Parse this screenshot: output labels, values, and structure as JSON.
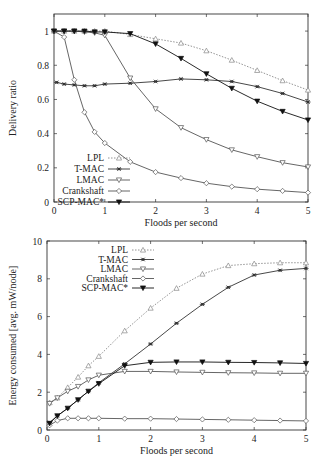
{
  "chart_data": [
    {
      "type": "line",
      "title": "",
      "xlabel": "Floods per second",
      "ylabel": "Delivery ratio",
      "xlim": [
        0,
        5
      ],
      "ylim": [
        0,
        1.1
      ],
      "xticks": [
        "0",
        "1",
        "2",
        "3",
        "4",
        "5"
      ],
      "yticks": [
        "0",
        "0.2",
        "0.4",
        "0.6",
        "0.8",
        "1"
      ],
      "grid": false,
      "legend_position": "lower left",
      "series": [
        {
          "name": "LPL",
          "style": "dotted",
          "marker": "triangle-up-open",
          "x": [
            0,
            0.2,
            0.4,
            0.6,
            0.8,
            1,
            1.5,
            2,
            2.5,
            3,
            3.5,
            4,
            4.5,
            5
          ],
          "values": [
            1,
            1,
            1,
            1,
            1,
            1,
            0.98,
            0.955,
            0.93,
            0.885,
            0.83,
            0.77,
            0.71,
            0.655
          ]
        },
        {
          "name": "T-MAC",
          "style": "solid",
          "marker": "star",
          "x": [
            0.05,
            0.2,
            0.4,
            0.6,
            0.8,
            1,
            1.5,
            2,
            2.5,
            3,
            3.5,
            4,
            4.5,
            5
          ],
          "values": [
            0.7,
            0.69,
            0.685,
            0.68,
            0.68,
            0.69,
            0.695,
            0.705,
            0.72,
            0.715,
            0.705,
            0.675,
            0.635,
            0.585
          ]
        },
        {
          "name": "LMAC",
          "style": "solid",
          "marker": "triangle-down-open",
          "x": [
            0,
            0.2,
            0.4,
            0.6,
            0.8,
            1,
            1.5,
            2,
            2.5,
            3,
            3.5,
            4,
            4.5,
            5
          ],
          "values": [
            1,
            1,
            1,
            0.995,
            0.99,
            0.975,
            0.725,
            0.545,
            0.435,
            0.365,
            0.305,
            0.265,
            0.23,
            0.205
          ]
        },
        {
          "name": "Crankshaft",
          "style": "solid",
          "marker": "diamond-open",
          "x": [
            0,
            0.2,
            0.4,
            0.6,
            0.8,
            1,
            1.5,
            2,
            2.5,
            3,
            3.5,
            4,
            4.5,
            5
          ],
          "values": [
            1,
            0.965,
            0.715,
            0.525,
            0.41,
            0.345,
            0.235,
            0.175,
            0.14,
            0.11,
            0.09,
            0.075,
            0.065,
            0.055
          ]
        },
        {
          "name": "SCP-MAC*",
          "style": "solid",
          "marker": "triangle-down-filled",
          "x": [
            0,
            0.2,
            0.4,
            0.6,
            0.8,
            1,
            1.5,
            2,
            2.5,
            3,
            3.5,
            4,
            4.5,
            5
          ],
          "values": [
            1,
            1,
            1,
            1,
            0.995,
            0.995,
            0.985,
            0.925,
            0.84,
            0.75,
            0.665,
            0.59,
            0.53,
            0.48
          ]
        }
      ]
    },
    {
      "type": "line",
      "title": "",
      "xlabel": "Floods per second",
      "ylabel": "Energy consumed [avg. mW/node]",
      "xlim": [
        0,
        5
      ],
      "ylim": [
        0,
        10
      ],
      "xticks": [
        "0",
        "1",
        "2",
        "3",
        "4",
        "5"
      ],
      "yticks": [
        "0",
        "2",
        "4",
        "6",
        "8",
        "10"
      ],
      "grid": false,
      "legend_position": "upper left",
      "series": [
        {
          "name": "LPL",
          "style": "dotted",
          "marker": "triangle-up-open",
          "x": [
            0.05,
            0.2,
            0.4,
            0.6,
            0.8,
            1,
            1.5,
            2,
            2.5,
            3,
            3.5,
            4,
            4.5,
            5
          ],
          "values": [
            1.45,
            1.7,
            2.25,
            2.8,
            3.4,
            3.9,
            5.25,
            6.45,
            7.5,
            8.25,
            8.7,
            8.8,
            8.85,
            8.85
          ]
        },
        {
          "name": "T-MAC",
          "style": "solid",
          "marker": "star",
          "x": [
            0.05,
            0.2,
            0.4,
            0.6,
            0.8,
            1,
            1.5,
            2,
            2.5,
            3,
            3.5,
            4,
            4.5,
            5
          ],
          "values": [
            0.4,
            0.75,
            1.15,
            1.6,
            2.05,
            2.5,
            3.5,
            4.55,
            5.65,
            6.65,
            7.55,
            8.2,
            8.45,
            8.55
          ]
        },
        {
          "name": "LMAC",
          "style": "solid",
          "marker": "triangle-down-open",
          "x": [
            0.05,
            0.2,
            0.4,
            0.6,
            0.8,
            1,
            1.5,
            2,
            2.5,
            3,
            3.5,
            4,
            4.5,
            5
          ],
          "values": [
            1.4,
            1.7,
            2.05,
            2.3,
            2.65,
            2.9,
            3.1,
            3.1,
            3.07,
            3.05,
            3.03,
            3.02,
            3.0,
            3.0
          ]
        },
        {
          "name": "Crankshaft",
          "style": "solid",
          "marker": "diamond-open",
          "x": [
            0.05,
            0.2,
            0.4,
            0.6,
            0.8,
            1,
            1.5,
            2,
            2.5,
            3,
            3.5,
            4,
            4.5,
            5
          ],
          "values": [
            0.25,
            0.5,
            0.62,
            0.62,
            0.62,
            0.62,
            0.6,
            0.6,
            0.58,
            0.56,
            0.54,
            0.52,
            0.5,
            0.48
          ]
        },
        {
          "name": "SCP-MAC*",
          "style": "solid",
          "marker": "triangle-down-filled",
          "x": [
            0.05,
            0.2,
            0.4,
            0.6,
            0.8,
            1,
            1.5,
            2,
            2.5,
            3,
            3.5,
            4,
            4.5,
            5
          ],
          "values": [
            0.35,
            0.75,
            1.15,
            1.6,
            2.05,
            2.45,
            3.4,
            3.58,
            3.6,
            3.6,
            3.58,
            3.57,
            3.55,
            3.52
          ]
        }
      ]
    }
  ],
  "colors": {
    "frame": "#333333",
    "line_dark": "#1a1a1a",
    "line_gray": "#555555",
    "lpl": "#777777"
  }
}
